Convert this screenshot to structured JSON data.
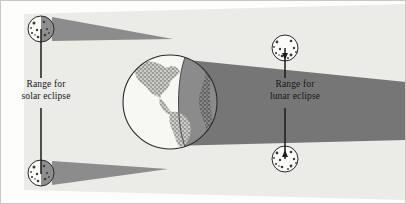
{
  "labels": {
    "solar": {
      "line1": "Range for",
      "line2": "solar eclipse"
    },
    "lunar": {
      "line1": "Range for",
      "line2": "lunar eclipse"
    }
  },
  "bodies": {
    "earth": {
      "name": "Earth",
      "cx": 170,
      "cy": 102,
      "r": 47,
      "continents": "Americas",
      "lit_side": "left",
      "dark_side": "right"
    },
    "moons": [
      {
        "name": "moon-solar-upper",
        "cx": 41,
        "cy": 29,
        "r": 13,
        "role": "solar-eclipse-upper-limit",
        "phase": "new",
        "casts_shadow": true
      },
      {
        "name": "moon-solar-lower",
        "cx": 41,
        "cy": 173,
        "r": 13,
        "role": "solar-eclipse-lower-limit",
        "phase": "new",
        "casts_shadow": true
      },
      {
        "name": "moon-lunar-upper",
        "cx": 285,
        "cy": 48,
        "r": 13,
        "role": "lunar-eclipse-upper-limit",
        "phase": "full",
        "casts_shadow": false
      },
      {
        "name": "moon-lunar-lower",
        "cx": 285,
        "cy": 159,
        "r": 13,
        "role": "lunar-eclipse-lower-limit",
        "phase": "full",
        "casts_shadow": false
      }
    ]
  },
  "shadows": {
    "moon_cone_upper": {
      "name": "moon-shadow-cone-upper",
      "from": [
        52,
        18
      ],
      "to": [
        172,
        39
      ],
      "color": "#8c8c8c"
    },
    "moon_cone_lower": {
      "name": "moon-shadow-cone-lower",
      "from": [
        52,
        184
      ],
      "to": [
        168,
        169
      ],
      "color": "#8c8c8c"
    },
    "earth_umbra": {
      "name": "earth-umbra-band",
      "color": "#767676",
      "extends": "right"
    },
    "sunlight_band": {
      "name": "sunlight-band",
      "color": "#ebebe8"
    }
  },
  "colors": {
    "shadow_dark": "#767676",
    "shadow_cone": "#8c8c8c",
    "sunlight": "#ebebe8",
    "paper": "#fdfdfc",
    "ink": "#16161a",
    "moon_lit": "#fbfbf8",
    "moon_dark": "#8e8e8e",
    "earth_lit": "#f7f7f4",
    "earth_dark": "#8b8b8b",
    "continent": "#5a5a5a",
    "border": "#c9c9c4"
  },
  "connectors": [
    {
      "name": "leader-solar-upper",
      "from": [
        41,
        42
      ],
      "to": [
        41,
        78
      ]
    },
    {
      "name": "leader-solar-lower",
      "from": [
        41,
        108
      ],
      "to": [
        41,
        162
      ]
    },
    {
      "name": "leader-lunar-upper",
      "from": [
        285,
        60
      ],
      "to": [
        285,
        78
      ]
    },
    {
      "name": "leader-lunar-lower",
      "from": [
        285,
        108
      ],
      "to": [
        285,
        150
      ]
    }
  ]
}
